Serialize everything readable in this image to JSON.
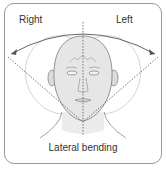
{
  "diagram": {
    "title": "Lateral bending",
    "labels": {
      "right": "Right",
      "left": "Left"
    },
    "caption": "Lateral bending",
    "colors": {
      "skin": "#e6e6e6",
      "outline": "#7a7a7a",
      "frame": "#9a9a9a",
      "text": "#333333"
    }
  }
}
